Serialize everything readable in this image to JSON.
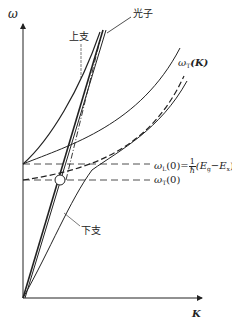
{
  "diagram": {
    "type": "polariton-dispersion",
    "axes": {
      "y_label": "ω",
      "x_label": "K"
    },
    "labels": {
      "photon": "光子",
      "upper_branch": "上支",
      "lower_branch": "下支",
      "omega_T_K": "ω",
      "omega_T_K_sub": "T",
      "omega_T_K_arg": "(K)",
      "omega_L0_sym": "ω",
      "omega_L0_sub": "L",
      "omega_L0_arg": "(0)=",
      "frac_num": "1",
      "frac_den": "ħ",
      "omega_L0_expr": "(E",
      "Eg_sub": "g",
      "minus": "−E",
      "Ex_sub": "x",
      "close_paren": ")",
      "omega_T0_sym": "ω",
      "omega_T0_sub": "T",
      "omega_T0_arg": "(0)"
    },
    "colors": {
      "line": "#222222",
      "background": "#ffffff"
    }
  }
}
